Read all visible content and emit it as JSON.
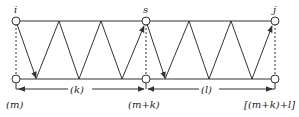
{
  "diagram": {
    "nodes": {
      "top_left": "i",
      "top_mid": "s",
      "top_right": "j"
    },
    "intervals": {
      "first": "(k)",
      "second": "(l)"
    },
    "positions": {
      "start": "(m)",
      "mid": "(m+k)",
      "end": "[(m+k)+l]"
    },
    "colors": {
      "stroke": "#333333",
      "background": "#ffffff"
    }
  }
}
